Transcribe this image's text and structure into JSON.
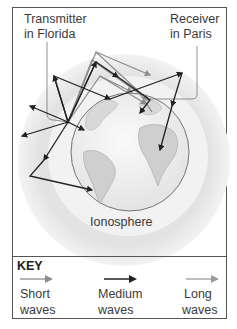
{
  "labels": {
    "transmitter_line1": "Transmitter",
    "transmitter_line2": "in Florida",
    "receiver_line1": "Receiver",
    "receiver_line2": "in Paris",
    "ionosphere": "Ionosphere"
  },
  "key": {
    "title": "KEY",
    "items": [
      {
        "line1": "Short",
        "line2": "waves",
        "color": "#8c8c8c",
        "icon": "gray-arrow-icon"
      },
      {
        "line1": "Medium",
        "line2": "waves",
        "color": "#222222",
        "icon": "black-arrow-icon"
      },
      {
        "line1": "Long",
        "line2": "waves",
        "color": "#9a9a9a",
        "icon": "gray-arrow-icon"
      }
    ]
  },
  "colors": {
    "ionosphere_outer": "#e2e2e2",
    "ionosphere_inner": "#f1f1f1",
    "earth": "#f4f4f4",
    "land": "#c9c9c9",
    "medium_wave": "#222222",
    "short_wave": "#8c8c8c",
    "frame": "#555555"
  }
}
